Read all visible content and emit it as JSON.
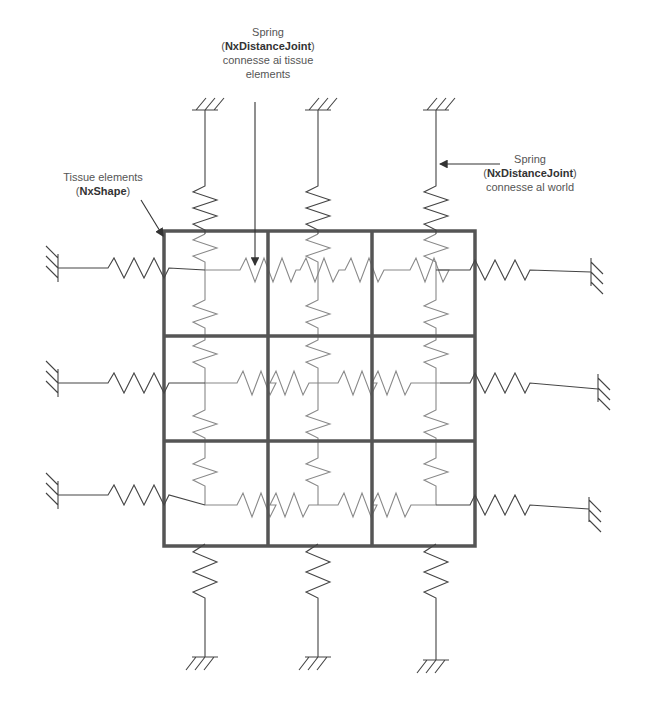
{
  "diagram": {
    "type": "mass-spring tissue model",
    "grid": {
      "rows": 3,
      "cols": 3,
      "frame_color": "#555555"
    },
    "labels": {
      "tissue": {
        "line1": "Tissue elements",
        "open": "(",
        "bold": "NxShape",
        "close": ")"
      },
      "spring_tissue": {
        "line1": "Spring",
        "open": "(",
        "bold": "NxDistanceJoint",
        "close": ")",
        "line3": "connesse ai tissue",
        "line4": "elements"
      },
      "spring_world": {
        "line1": "Spring",
        "open": "(",
        "bold": "NxDistanceJoint",
        "close": ")",
        "line3": "connesse al world"
      }
    },
    "components": [
      {
        "name": "tissue-element",
        "count": 9
      },
      {
        "name": "world-spring-top",
        "count": 3
      },
      {
        "name": "world-spring-bottom",
        "count": 3
      },
      {
        "name": "world-spring-left",
        "count": 3
      },
      {
        "name": "world-spring-right",
        "count": 3
      },
      {
        "name": "internal-spring-horizontal",
        "count": 6
      },
      {
        "name": "internal-spring-vertical",
        "count": 6
      }
    ]
  }
}
